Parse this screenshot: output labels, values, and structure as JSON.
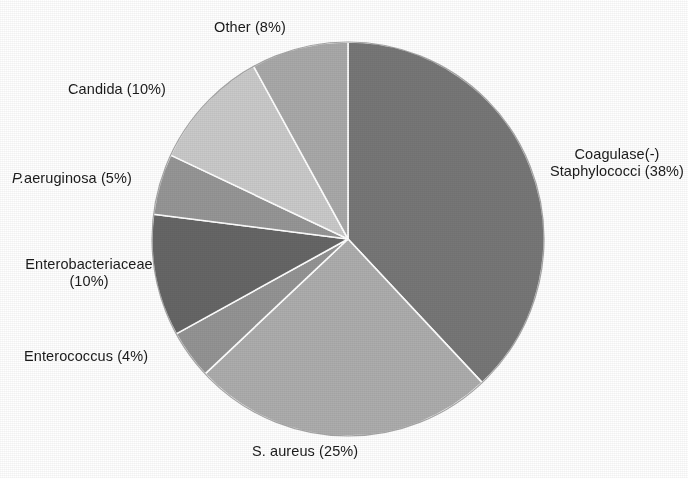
{
  "chart_data": {
    "type": "pie",
    "title": "",
    "subtitle": "",
    "legend_position": "outside-labels",
    "grid": false,
    "start_angle_deg": 0,
    "direction": "clockwise",
    "total_percent": 100,
    "categories": [
      "Coagulase(-) Staphylococci",
      "S. aureus",
      "Enterococcus",
      "Enterobacteriaceae",
      "P.aeruginosa",
      "Candida",
      "Other"
    ],
    "values": [
      38,
      25,
      4,
      10,
      5,
      10,
      8
    ],
    "slices": [
      {
        "name": "coagulase-negative-staphylococci",
        "label_line1": "Coagulase(-)",
        "label_line2": "Staphylococci (38%)",
        "label_full": "Coagulase(-) Staphylococci (38%)",
        "value": 38,
        "percent_text": "38%",
        "color": "#777777"
      },
      {
        "name": "s-aureus",
        "label_full": "S. aureus (25%)",
        "value": 25,
        "percent_text": "25%",
        "color": "#adadad"
      },
      {
        "name": "enterococcus",
        "label_full": "Enterococcus (4%)",
        "value": 4,
        "percent_text": "4%",
        "color": "#949494"
      },
      {
        "name": "enterobacteriaceae",
        "label_line1": "Enterobacteriaceae",
        "label_line2": "(10%)",
        "label_full": "Enterobacteriaceae (10%)",
        "value": 10,
        "percent_text": "10%",
        "color": "#666666"
      },
      {
        "name": "p-aeruginosa",
        "label_italic_prefix": "P.",
        "label_rest": "aeruginosa (5%)",
        "label_full": "P.aeruginosa (5%)",
        "value": 5,
        "percent_text": "5%",
        "color": "#969696"
      },
      {
        "name": "candida",
        "label_full": "Candida (10%)",
        "value": 10,
        "percent_text": "10%",
        "color": "#cacaca"
      },
      {
        "name": "other",
        "label_full": "Other (8%)",
        "value": 8,
        "percent_text": "8%",
        "color": "#a9a9a9"
      }
    ],
    "colors": [
      "#777777",
      "#adadad",
      "#949494",
      "#666666",
      "#969696",
      "#cacaca",
      "#a9a9a9"
    ],
    "separator_color": "#ffffff",
    "background_color": "#ffffff",
    "text_color": "#1b1b1b"
  },
  "labels": {
    "other": "Other (8%)",
    "candida": "Candida (10%)",
    "paeruginosa_italic": "P.",
    "paeruginosa_rest": "aeruginosa (5%)",
    "enterobacteriaceae_line1": "Enterobacteriaceae",
    "enterobacteriaceae_line2": "(10%)",
    "enterococcus": "Enterococcus (4%)",
    "saureus": "S. aureus (25%)",
    "coagulase_line1": "Coagulase(-)",
    "coagulase_line2": "Staphylococci (38%)"
  }
}
